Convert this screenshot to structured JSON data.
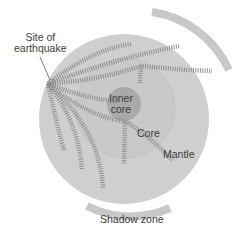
{
  "diagram": {
    "labels": {
      "earthquake": [
        "Site of",
        "earthquake"
      ],
      "inner_core": [
        "Inner",
        "core"
      ],
      "core": "Core",
      "mantle": "Mantle",
      "shadow_zone": "Shadow zone"
    },
    "colors": {
      "mantle": "#cfcfcf",
      "core_boundary": "#c2c2c2",
      "inner_core": "#a9a9a9",
      "shadow_arc": "#c8c8c8",
      "wave": "#8a8a8a",
      "text": "#3c3c3c"
    }
  }
}
